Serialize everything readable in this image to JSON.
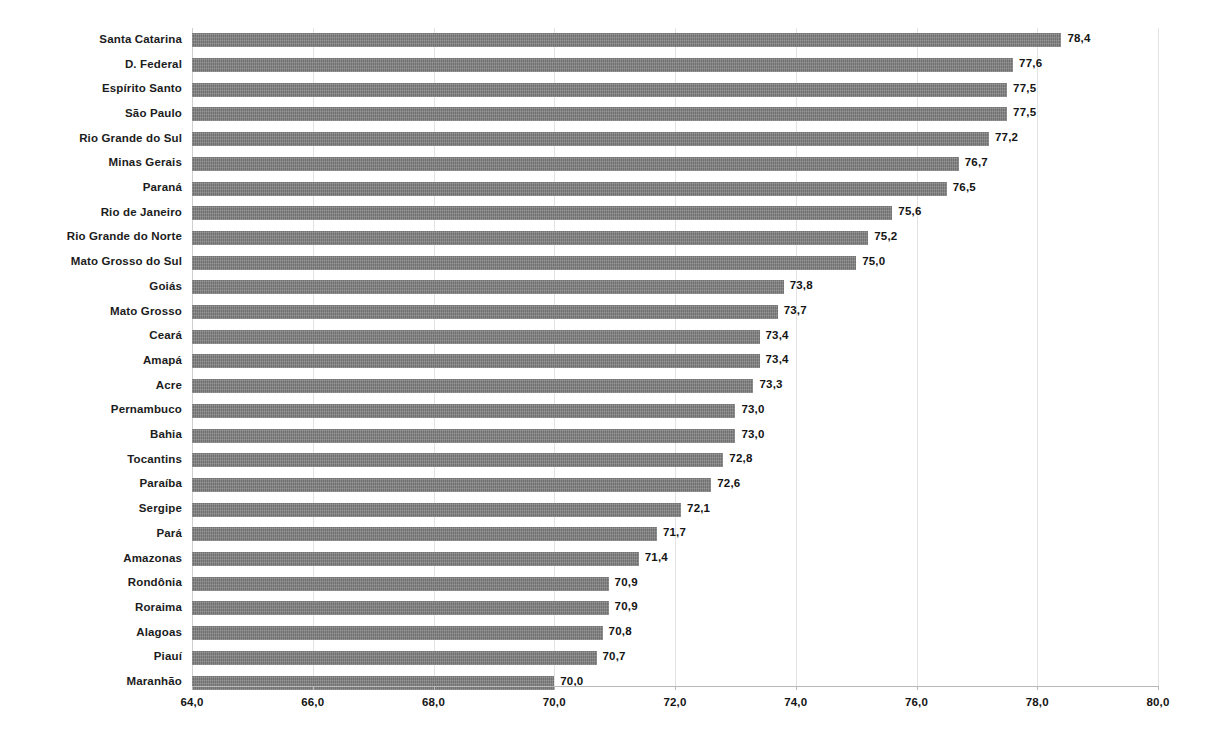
{
  "chart_data": {
    "type": "bar",
    "orientation": "horizontal",
    "title": "",
    "subtitle": "",
    "xlabel": "",
    "ylabel": "",
    "xlim": [
      64.0,
      80.0
    ],
    "xtick_step": 2.0,
    "grid": true,
    "legend": "none",
    "decimal_separator": ",",
    "bar_color": "#7e7e7e",
    "categories": [
      "Santa Catarina",
      "D. Federal",
      "Espírito Santo",
      "São Paulo",
      "Rio Grande do Sul",
      "Minas Gerais",
      "Paraná",
      "Rio de Janeiro",
      "Rio Grande do Norte",
      "Mato Grosso do Sul",
      "Goiás",
      "Mato Grosso",
      "Ceará",
      "Amapá",
      "Acre",
      "Pernambuco",
      "Bahia",
      "Tocantins",
      "Paraíba",
      "Sergipe",
      "Pará",
      "Amazonas",
      "Rondônia",
      "Roraima",
      "Alagoas",
      "Piauí",
      "Maranhão"
    ],
    "values": [
      78.4,
      77.6,
      77.5,
      77.5,
      77.2,
      76.7,
      76.5,
      75.6,
      75.2,
      75.0,
      73.8,
      73.7,
      73.4,
      73.4,
      73.3,
      73.0,
      73.0,
      72.8,
      72.6,
      72.1,
      71.7,
      71.4,
      70.9,
      70.9,
      70.8,
      70.7,
      70.0
    ],
    "value_labels": [
      "78,4",
      "77,6",
      "77,5",
      "77,5",
      "77,2",
      "76,7",
      "76,5",
      "75,6",
      "75,2",
      "75,0",
      "73,8",
      "73,7",
      "73,4",
      "73,4",
      "73,3",
      "73,0",
      "73,0",
      "72,8",
      "72,6",
      "72,1",
      "71,7",
      "71,4",
      "70,9",
      "70,9",
      "70,8",
      "70,7",
      "70,0"
    ],
    "xtick_labels": [
      "64,0",
      "66,0",
      "68,0",
      "70,0",
      "72,0",
      "74,0",
      "76,0",
      "78,0",
      "80,0"
    ],
    "xtick_values": [
      64.0,
      66.0,
      68.0,
      70.0,
      72.0,
      74.0,
      76.0,
      78.0,
      80.0
    ]
  }
}
